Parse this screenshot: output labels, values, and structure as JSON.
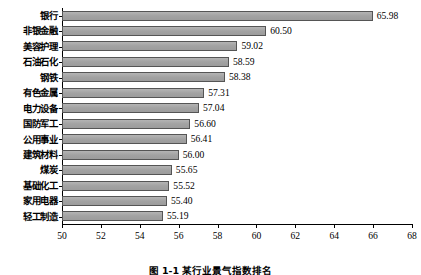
{
  "chart_data": {
    "type": "bar",
    "orientation": "horizontal",
    "title": "",
    "xlabel": "",
    "ylabel": "",
    "xlim": [
      50,
      68
    ],
    "xticks": [
      50,
      52,
      54,
      56,
      58,
      60,
      62,
      64,
      66,
      68
    ],
    "grid": false,
    "legend": null,
    "bar_color": "#a9a9a9",
    "bar_edge_color": "#555555",
    "categories": [
      "银行",
      "非银金融",
      "美容护理",
      "石油石化",
      "钢铁",
      "有色金属",
      "电力设备",
      "国防军工",
      "公用事业",
      "建筑材料",
      "煤炭",
      "基础化工",
      "家用电器",
      "轻工制造"
    ],
    "values": [
      65.98,
      60.5,
      59.02,
      58.59,
      58.38,
      57.31,
      57.04,
      56.6,
      56.41,
      56.0,
      55.65,
      55.52,
      55.4,
      55.19
    ],
    "value_labels": [
      "65.98",
      "60.50",
      "59.02",
      "58.59",
      "58.38",
      "57.31",
      "57.04",
      "56.60",
      "56.41",
      "56.00",
      "55.65",
      "55.52",
      "55.40",
      "55.19"
    ],
    "xtick_labels": [
      "50",
      "52",
      "54",
      "56",
      "58",
      "60",
      "62",
      "64",
      "66",
      "68"
    ]
  },
  "caption": "图 1-1  某行业景气指数排名"
}
